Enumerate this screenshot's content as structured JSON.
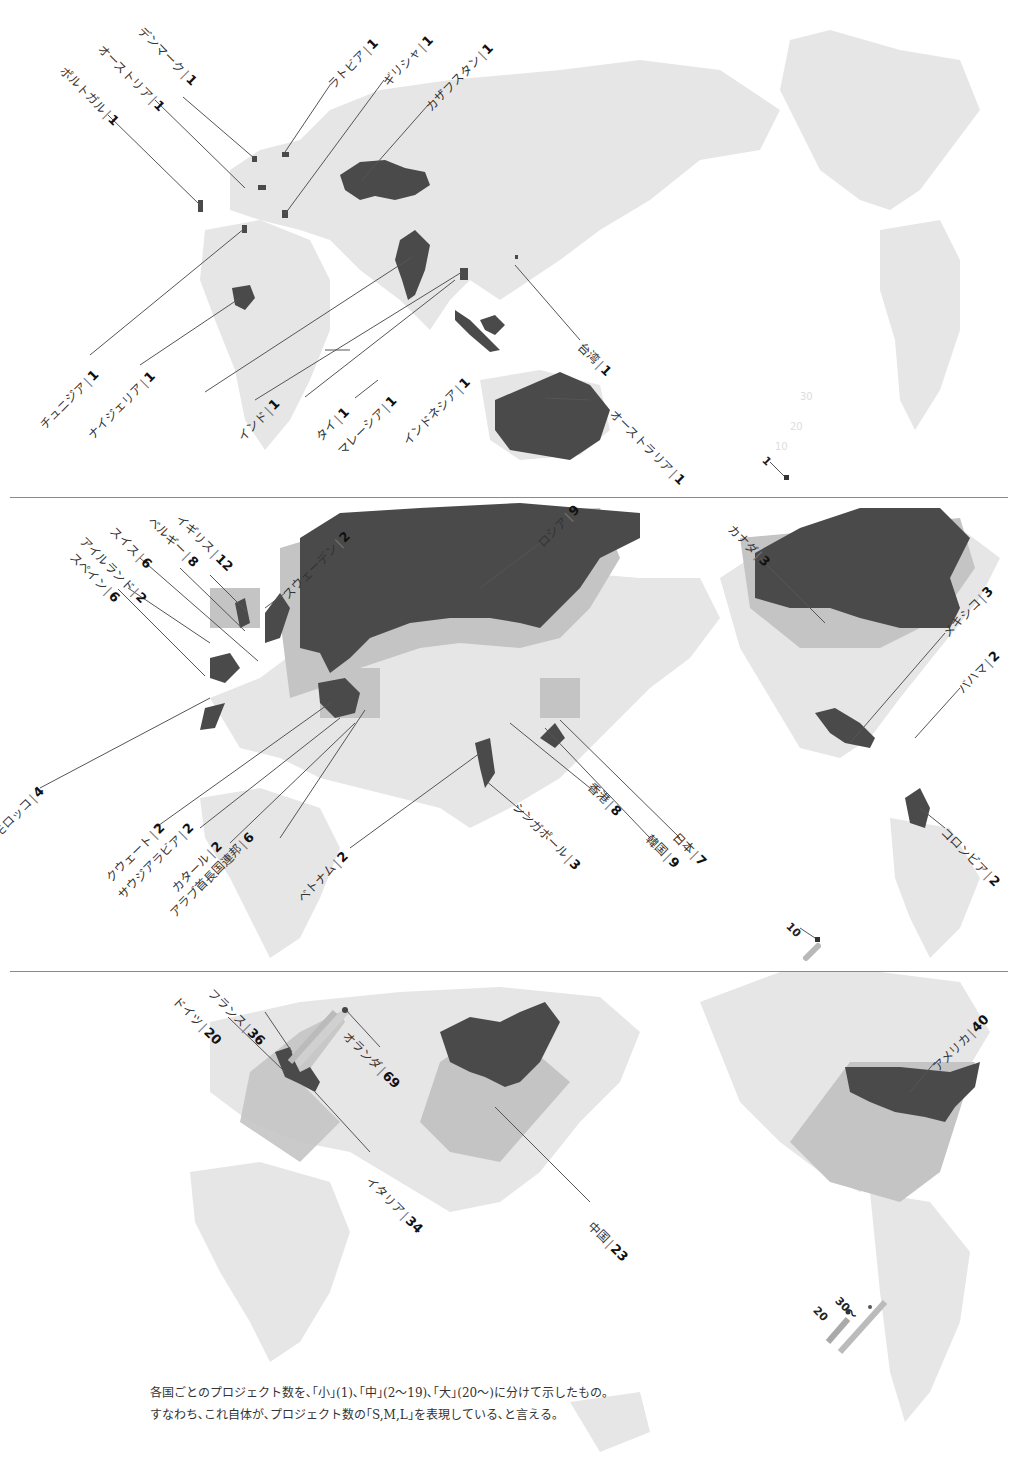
{
  "panels": [
    {
      "id": "small",
      "category": "小",
      "range": "1",
      "legend_value": "1",
      "countries": [
        {
          "name": "デンマーク",
          "count": 1
        },
        {
          "name": "オーストリア",
          "count": 1
        },
        {
          "name": "ポルトガル",
          "count": 1
        },
        {
          "name": "ラトビア",
          "count": 1
        },
        {
          "name": "ギリシャ",
          "count": 1
        },
        {
          "name": "カザフスタン",
          "count": 1
        },
        {
          "name": "チュニジア",
          "count": 1
        },
        {
          "name": "ナイジェリア",
          "count": 1
        },
        {
          "name": "インド",
          "count": 1
        },
        {
          "name": "タイ",
          "count": 1
        },
        {
          "name": "マレーシア",
          "count": 1
        },
        {
          "name": "インドネシア",
          "count": 1
        },
        {
          "name": "台湾",
          "count": 1
        },
        {
          "name": "オーストラリア",
          "count": 1
        }
      ]
    },
    {
      "id": "medium",
      "category": "中",
      "range": "2〜19",
      "legend_value": "10",
      "countries": [
        {
          "name": "イギリス",
          "count": 12
        },
        {
          "name": "ベルギー",
          "count": 8
        },
        {
          "name": "スイス",
          "count": 6
        },
        {
          "name": "アイルランド",
          "count": 2
        },
        {
          "name": "スペイン",
          "count": 6
        },
        {
          "name": "スウェーデン",
          "count": 2
        },
        {
          "name": "ロシア",
          "count": 9
        },
        {
          "name": "カナダ",
          "count": 3
        },
        {
          "name": "メキシコ",
          "count": 3
        },
        {
          "name": "バハマ",
          "count": 2
        },
        {
          "name": "モロッコ",
          "count": 4
        },
        {
          "name": "クウェート",
          "count": 2
        },
        {
          "name": "サウジアラビア",
          "count": 2
        },
        {
          "name": "カタール",
          "count": 2
        },
        {
          "name": "アラブ首長国連邦",
          "count": 6
        },
        {
          "name": "ベトナム",
          "count": 2
        },
        {
          "name": "シンガポール",
          "count": 3
        },
        {
          "name": "香港",
          "count": 8
        },
        {
          "name": "韓国",
          "count": 9
        },
        {
          "name": "日本",
          "count": 7
        },
        {
          "name": "コロンビア",
          "count": 2
        }
      ]
    },
    {
      "id": "large",
      "category": "大",
      "range": "20〜",
      "legend_values": [
        "20",
        "30〜"
      ],
      "countries": [
        {
          "name": "フランス",
          "count": 36
        },
        {
          "name": "ドイツ",
          "count": 20
        },
        {
          "name": "オランダ",
          "count": 69
        },
        {
          "name": "イタリア",
          "count": 34
        },
        {
          "name": "中国",
          "count": 23
        },
        {
          "name": "アメリカ",
          "count": 40
        }
      ]
    }
  ],
  "caption": {
    "line1": "各国ごとのプロジェクト数を､｢小｣(1)､｢中｣(2〜19)､｢大｣(20〜)に分けて示したもの｡",
    "line2": "すなわち､これ自体が､プロジェクト数の｢S,M,L｣を表現している､と言える｡"
  },
  "colors": {
    "land": "#e6e6e6",
    "highlight": "#4a4a4a",
    "extrusion": "#c4c4c4",
    "leader": "#555555",
    "separator": "#8a8a8a"
  }
}
